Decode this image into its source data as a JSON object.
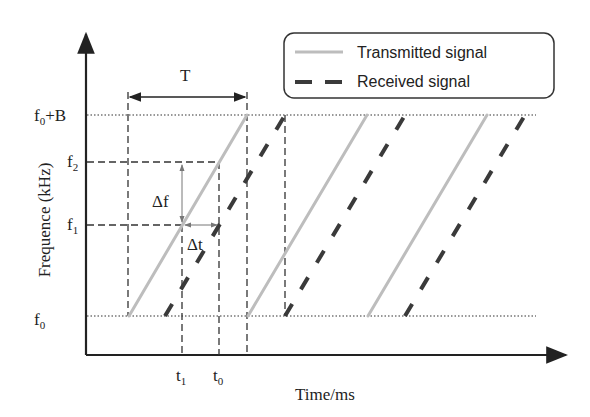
{
  "diagram": {
    "type": "FMCW sawtooth chirp timing diagram",
    "y_axis": {
      "label": "Frequence (kHz)",
      "ticks": [
        {
          "base": "f",
          "sub": "0",
          "suffix": "+B"
        },
        {
          "base": "f",
          "sub": "2",
          "suffix": ""
        },
        {
          "base": "f",
          "sub": "1",
          "suffix": ""
        },
        {
          "base": "f",
          "sub": "0",
          "suffix": ""
        }
      ]
    },
    "x_axis": {
      "label": "Time/ms",
      "ticks": [
        {
          "base": "t",
          "sub": "1"
        },
        {
          "base": "t",
          "sub": "0"
        }
      ]
    },
    "annotations": {
      "period": "T",
      "delta_f": "Δf",
      "delta_t": "Δt"
    },
    "legend": {
      "items": [
        {
          "label": "Transmitted signal",
          "style": "solid",
          "color": "#bdbdbd"
        },
        {
          "label": "Received signal",
          "style": "dashed",
          "color": "#3a3a3a"
        }
      ]
    },
    "colors": {
      "transmitted": "#bdbdbd",
      "received": "#3a3a3a",
      "axis": "#222222",
      "guide": "#333333"
    }
  }
}
